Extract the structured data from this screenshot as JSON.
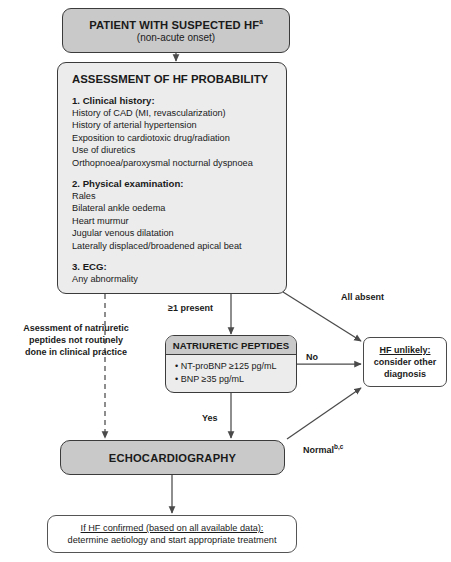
{
  "diagram": {
    "colors": {
      "header_fill": "#c9c9c9",
      "body_fill": "#ececec",
      "border": "#3b3b3b",
      "white_fill": "#ffffff",
      "text": "#1a1a1a"
    }
  },
  "nodes": {
    "patient": {
      "title": "PATIENT WITH SUSPECTED HF",
      "title_sup": "a",
      "subtitle": "(non-acute onset)"
    },
    "assessment": {
      "header": "ASSESSMENT OF HF PROBABILITY",
      "sections": [
        {
          "number": "1.",
          "heading": "1. Clinical history:",
          "items": [
            "History of CAD (MI, revascularization)",
            "History of arterial hypertension",
            "Exposition to cardiotoxic drug/radiation",
            "Use of diuretics",
            "Orthopnoea/paroxysmal nocturnal dyspnoea"
          ]
        },
        {
          "number": "2.",
          "heading": "2. Physical examination:",
          "items": [
            "Rales",
            "Bilateral ankle oedema",
            "Heart murmur",
            "Jugular venous dilatation",
            "Laterally displaced/broadened apical beat"
          ]
        },
        {
          "number": "3.",
          "heading": "3. ECG:",
          "items": [
            "Any abnormality"
          ]
        }
      ]
    },
    "natriuretic": {
      "header": "NATRIURETIC PEPTIDES",
      "items": [
        "• NT-proBNP ≥125 pg/mL",
        "• BNP ≥35 pg/mL"
      ]
    },
    "hf_unlikely": {
      "line1": "HF unlikely:",
      "line2": "consider other",
      "line3": "diagnosis"
    },
    "echocardiography": {
      "title": "ECHOCARDIOGRAPHY"
    },
    "final": {
      "line1": "If HF confirmed (based on all available data):",
      "line2": "determine aetiology and start appropriate treatment"
    }
  },
  "edge_labels": {
    "at_least_one_present": "≥1 present",
    "all_absent": "All absent",
    "no": "No",
    "yes": "Yes",
    "normal": "Normal",
    "normal_sup": "b,c"
  },
  "annotations": {
    "dashed_note": "Asessment of natriuretic peptides not routinely done in clinical practice"
  }
}
